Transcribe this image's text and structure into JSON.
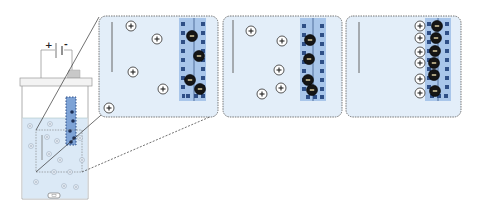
{
  "diagram": {
    "battery": {
      "positive_label": "+",
      "negative_label": "-"
    },
    "colors": {
      "solution": "#dbe9f6",
      "panel_fill": "#e3eef9",
      "panel_border": "#555555",
      "electrode_band": "#8fb3e0",
      "electrode_dots": "#2f4f86",
      "anion_fill": "#1a1a1a",
      "cation_stroke": "#444444",
      "beaker_stroke": "#888888",
      "zoom_line": "#333333"
    },
    "ion_labels": {
      "cation": "+",
      "anion": "-"
    },
    "panels": [
      {
        "name": "stage-1",
        "description": "Cations dispersed, anions adsorbed on electrode",
        "cation_count": 5,
        "anion_count": 4
      },
      {
        "name": "stage-2",
        "description": "Cations migrating toward electrode",
        "cation_count": 5,
        "anion_count": 4
      },
      {
        "name": "stage-3",
        "description": "Cations aligned forming double layer",
        "cation_count": 6,
        "anion_count": 6
      }
    ]
  }
}
